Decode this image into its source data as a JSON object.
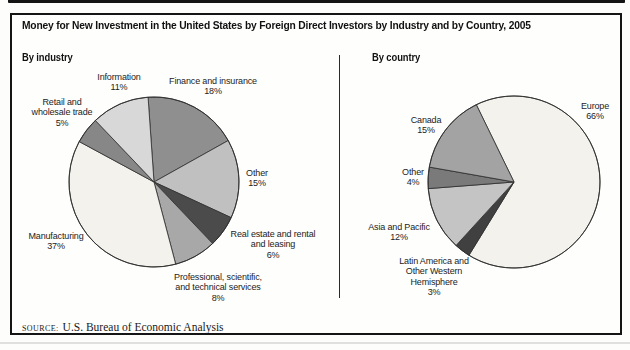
{
  "page": {
    "title": "Money for New Investment in the United States by Foreign Direct Investors by Industry and by Country, 2005",
    "source_label": "SOURCE:",
    "source_text": "U.S. Bureau of Economic Analysis"
  },
  "chart_data": [
    {
      "type": "pie",
      "title": "By industry",
      "unit": "percent",
      "start_angle_deg": -4,
      "center": {
        "x": 154,
        "y": 182
      },
      "radius": 85,
      "outline_color": "#2d2d2d",
      "slices": [
        {
          "label": "Finance and insurance",
          "value": 18,
          "color": "#8f8f8f",
          "label_lines": [
            "Finance and insurance",
            "18%"
          ],
          "label_pos": {
            "x": 213,
            "y": 76
          }
        },
        {
          "label": "Other",
          "value": 15,
          "color": "#c0c0c0",
          "label_lines": [
            "Other",
            "15%"
          ],
          "label_pos": {
            "x": 257,
            "y": 168
          }
        },
        {
          "label": "Real estate and rental and leasing",
          "value": 6,
          "color": "#4b4b4b",
          "label_lines": [
            "Real estate and rental",
            "and leasing",
            "6%"
          ],
          "label_pos": {
            "x": 273,
            "y": 229
          }
        },
        {
          "label": "Professional, scientific, and technical services",
          "value": 8,
          "color": "#a8a8a8",
          "label_lines": [
            "Professional, scientific,",
            "and technical services",
            "8%"
          ],
          "label_pos": {
            "x": 218,
            "y": 272
          }
        },
        {
          "label": "Manufacturing",
          "value": 37,
          "color": "#f4f2ec",
          "label_lines": [
            "Manufacturing",
            "37%"
          ],
          "label_pos": {
            "x": 56,
            "y": 231
          }
        },
        {
          "label": "Retail and wholesale trade",
          "value": 5,
          "color": "#878787",
          "label_lines": [
            "Retail and",
            "wholesale trade",
            "5%"
          ],
          "label_pos": {
            "x": 62,
            "y": 97
          }
        },
        {
          "label": "Information",
          "value": 11,
          "color": "#d8d8d8",
          "label_lines": [
            "Information",
            "11%"
          ],
          "label_pos": {
            "x": 119,
            "y": 72
          }
        }
      ]
    },
    {
      "type": "pie",
      "title": "By country",
      "unit": "percent",
      "start_angle_deg": -26,
      "center": {
        "x": 514,
        "y": 182
      },
      "radius": 86,
      "outline_color": "#2d2d2d",
      "slices": [
        {
          "label": "Europe",
          "value": 66,
          "color": "#f4f2ec",
          "label_lines": [
            "Europe",
            "66%"
          ],
          "label_pos": {
            "x": 595,
            "y": 101
          }
        },
        {
          "label": "Latin America and Other Western Hemisphere",
          "value": 3,
          "color": "#404040",
          "label_lines": [
            "Latin America and",
            "Other Western",
            "Hemisphere",
            "3%"
          ],
          "label_pos": {
            "x": 434,
            "y": 256
          }
        },
        {
          "label": "Asia and Pacific",
          "value": 12,
          "color": "#c4c4c4",
          "label_lines": [
            "Asia and Pacific",
            "12%"
          ],
          "label_pos": {
            "x": 399,
            "y": 222
          }
        },
        {
          "label": "Other",
          "value": 4,
          "color": "#7a7a7a",
          "label_lines": [
            "Other",
            "4%"
          ],
          "label_pos": {
            "x": 413,
            "y": 167
          }
        },
        {
          "label": "Canada",
          "value": 15,
          "color": "#a3a3a3",
          "label_lines": [
            "Canada",
            "15%"
          ],
          "label_pos": {
            "x": 426,
            "y": 115
          }
        }
      ]
    }
  ]
}
